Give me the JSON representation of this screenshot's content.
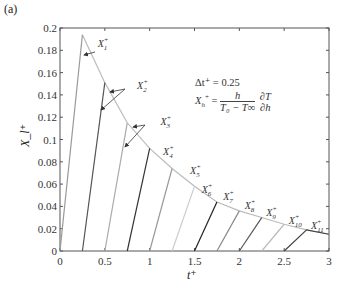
{
  "panel_label": "(a)",
  "annotation": {
    "delta_t": "Δt⁺ = 0.25",
    "formula_lhs": "X",
    "formula_lhs_sub": "h",
    "formula_num": "h",
    "formula_den": "T₀ − T∞",
    "formula_deriv_num": "∂T",
    "formula_deriv_den": "∂h"
  },
  "chart_data": {
    "type": "line",
    "title": "",
    "xlabel": "t⁺",
    "ylabel": "X_l⁺",
    "xlim": [
      0,
      3
    ],
    "ylim": [
      0,
      0.2
    ],
    "xticks": [
      0,
      0.5,
      1,
      1.5,
      2,
      2.5,
      3
    ],
    "xtick_labels": [
      "0",
      "0.5",
      "1",
      "1.5",
      "2",
      "2.5",
      "3"
    ],
    "yticks": [
      0,
      0.02,
      0.04,
      0.06,
      0.08,
      0.1,
      0.12,
      0.14,
      0.16,
      0.18,
      0.2
    ],
    "ytick_labels": [
      "0",
      "0.02",
      "0.04",
      "0.06",
      "0.08",
      "0.1",
      "0.12",
      "0.14",
      "0.16",
      "0.18",
      "0.2"
    ],
    "grid": false,
    "envelope": {
      "name": "envelope",
      "x": [
        0.25,
        0.5,
        0.75,
        1.0,
        1.25,
        1.5,
        1.75,
        2.0,
        2.25,
        2.5,
        2.75,
        3.0
      ],
      "y": [
        0.194,
        0.151,
        0.115,
        0.092,
        0.074,
        0.058,
        0.044,
        0.036,
        0.03,
        0.024,
        0.019,
        0.015
      ]
    },
    "series": [
      {
        "name": "X1+",
        "x": [
          0.0,
          0.25
        ],
        "y": [
          0,
          0.194
        ],
        "color": "#999999"
      },
      {
        "name": "X2+",
        "x": [
          0.25,
          0.5
        ],
        "y": [
          0,
          0.151
        ],
        "color": "#555555"
      },
      {
        "name": "X3+",
        "x": [
          0.5,
          0.75
        ],
        "y": [
          0,
          0.115
        ],
        "color": "#aaaaaa"
      },
      {
        "name": "X4+",
        "x": [
          0.75,
          1.0
        ],
        "y": [
          0,
          0.092
        ],
        "color": "#333333"
      },
      {
        "name": "X5+",
        "x": [
          1.0,
          1.25
        ],
        "y": [
          0,
          0.074
        ],
        "color": "#999999"
      },
      {
        "name": "X6+",
        "x": [
          1.25,
          1.5
        ],
        "y": [
          0,
          0.058
        ],
        "color": "#cccccc"
      },
      {
        "name": "X7+",
        "x": [
          1.5,
          1.75
        ],
        "y": [
          0,
          0.044
        ],
        "color": "#222222"
      },
      {
        "name": "X8+",
        "x": [
          1.75,
          2.0
        ],
        "y": [
          0,
          0.036
        ],
        "color": "#888888"
      },
      {
        "name": "X9+",
        "x": [
          2.0,
          2.25
        ],
        "y": [
          0,
          0.03
        ],
        "color": "#555555"
      },
      {
        "name": "X10+",
        "x": [
          2.25,
          2.5
        ],
        "y": [
          0,
          0.024
        ],
        "color": "#bbbbbb"
      },
      {
        "name": "X11+",
        "x": [
          2.5,
          2.75,
          3.0
        ],
        "y": [
          0,
          0.019,
          0.015
        ],
        "color": "#444444"
      }
    ],
    "labels": [
      {
        "text": "X",
        "sub": "1",
        "x": 0.42,
        "y": 0.183
      },
      {
        "text": "X",
        "sub": "2",
        "x": 0.86,
        "y": 0.145
      },
      {
        "text": "X",
        "sub": "3",
        "x": 1.12,
        "y": 0.113
      },
      {
        "text": "X",
        "sub": "4",
        "x": 1.15,
        "y": 0.086
      },
      {
        "text": "X",
        "sub": "5",
        "x": 1.45,
        "y": 0.069
      },
      {
        "text": "X",
        "sub": "6",
        "x": 1.58,
        "y": 0.052
      },
      {
        "text": "X",
        "sub": "7",
        "x": 1.82,
        "y": 0.046
      },
      {
        "text": "X",
        "sub": "8",
        "x": 2.06,
        "y": 0.038
      },
      {
        "text": "X",
        "sub": "9",
        "x": 2.3,
        "y": 0.031
      },
      {
        "text": "X",
        "sub": "10",
        "x": 2.55,
        "y": 0.024
      },
      {
        "text": "X",
        "sub": "11",
        "x": 2.8,
        "y": 0.02
      }
    ]
  }
}
